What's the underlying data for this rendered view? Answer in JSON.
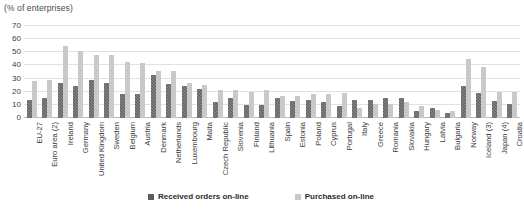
{
  "caption": "(% of enterprises)",
  "legend": {
    "items": [
      {
        "label": "Received orders on-line",
        "color": "#5c5c5c",
        "key": "received"
      },
      {
        "label": "Purchased on-line",
        "color": "#c9c9c9",
        "key": "purchased"
      }
    ]
  },
  "chart_data": {
    "type": "bar",
    "title": "",
    "subtitle": "",
    "xlabel": "",
    "ylabel": "(% of enterprises)",
    "ylim": [
      0,
      70
    ],
    "yticks": [
      0,
      10,
      20,
      30,
      40,
      50,
      60,
      70
    ],
    "grid": true,
    "legend_position": "bottom",
    "categories": [
      "EU-27",
      "Euro area (2)",
      "Ireland",
      "Germany",
      "United Kingdom",
      "Sweden",
      "Belgium",
      "Austria",
      "Denmark",
      "Netherlands",
      "Luxembourg",
      "Malta",
      "Czech Republic",
      "Slovenia",
      "Finland",
      "Lithuania",
      "Spain",
      "Estonia",
      "Poland",
      "Cyprus",
      "Portugal",
      "Italy",
      "Greece",
      "Romania",
      "Slovakia",
      "Hungary",
      "Latvia",
      "Bulgaria",
      "Norway",
      "Iceland (3)",
      "Japan (4)",
      "Croatia"
    ],
    "series": [
      {
        "name": "Received orders on-line",
        "color": "#5c5c5c",
        "values": [
          14,
          15,
          27,
          24,
          29,
          27,
          18,
          18,
          33,
          26,
          24,
          22,
          12,
          15,
          10,
          10,
          15,
          13,
          14,
          12,
          9,
          14,
          14,
          15,
          15,
          5,
          8,
          4,
          24,
          19,
          13,
          11
        ]
      },
      {
        "name": "Purchased on-line",
        "color": "#c9c9c9",
        "values": [
          28,
          29,
          55,
          51,
          48,
          48,
          43,
          42,
          36,
          36,
          27,
          25,
          21,
          21,
          20,
          21,
          17,
          17,
          18,
          18,
          19,
          8,
          11,
          11,
          12,
          9,
          6,
          5,
          45,
          39,
          20,
          20
        ]
      }
    ]
  }
}
